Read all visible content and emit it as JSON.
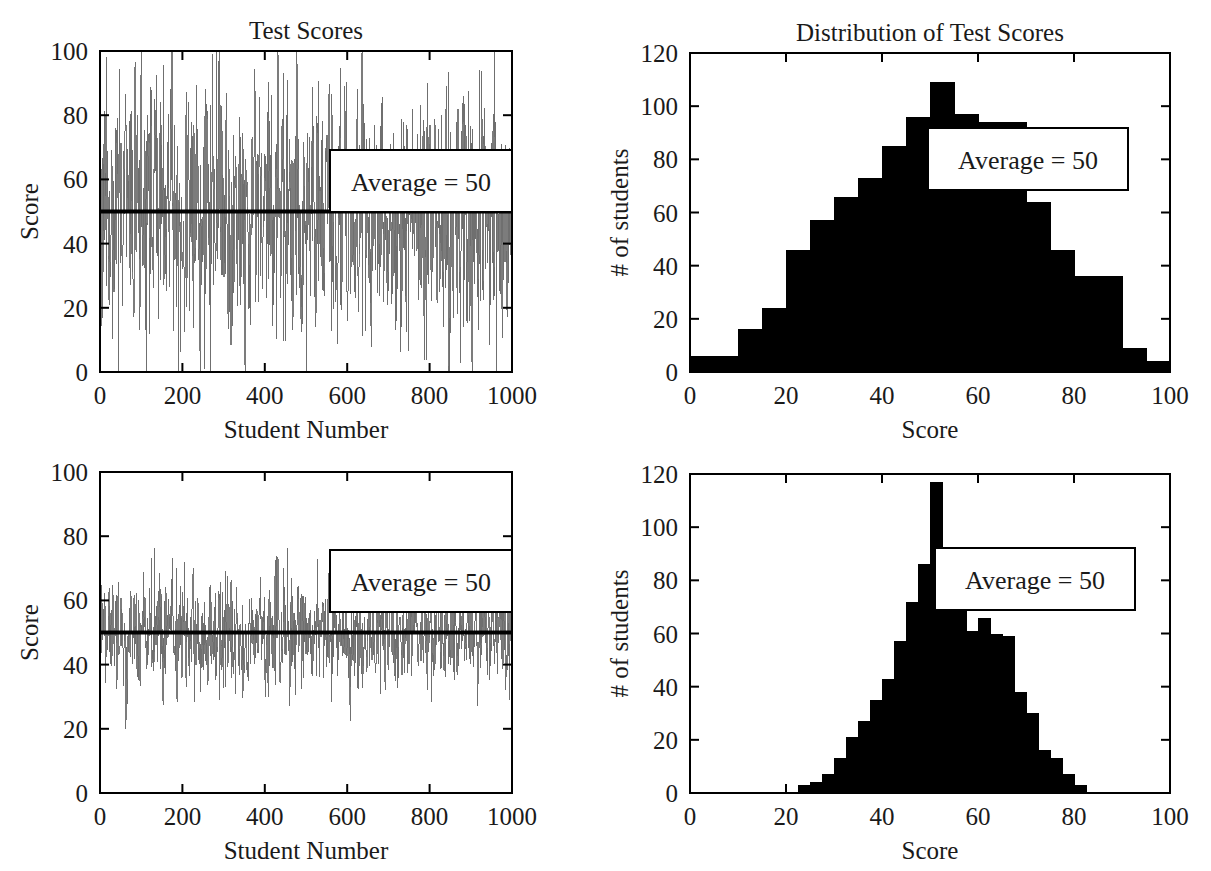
{
  "figure": {
    "background": "#ffffff",
    "ink_color": "#000000",
    "series_color": "#6e6e6e"
  },
  "panels": [
    {
      "id": "top-left",
      "name": "test-scores-series-uniform",
      "title": "Test Scores",
      "xlabel": "Student Number",
      "ylabel": "Score",
      "annotation": "Average = 50",
      "xticks": [
        0,
        200,
        400,
        600,
        800,
        1000
      ],
      "yticks": [
        0,
        20,
        40,
        60,
        80,
        100
      ],
      "xlim": [
        0,
        1000
      ],
      "ylim": [
        0,
        100
      ],
      "mean_line": 50
    },
    {
      "id": "top-right",
      "name": "distribution-uniform-wide",
      "title": "Distribution of Test Scores",
      "xlabel": "Score",
      "ylabel": "# of students",
      "annotation": "Average = 50",
      "xticks": [
        0,
        20,
        40,
        60,
        80,
        100
      ],
      "yticks": [
        0,
        20,
        40,
        60,
        80,
        100,
        120
      ],
      "xlim": [
        0,
        100
      ],
      "ylim": [
        0,
        120
      ]
    },
    {
      "id": "bottom-left",
      "name": "test-scores-series-narrow",
      "title": "",
      "xlabel": "Student Number",
      "ylabel": "Score",
      "annotation": "Average = 50",
      "xticks": [
        0,
        200,
        400,
        600,
        800,
        1000
      ],
      "yticks": [
        0,
        20,
        40,
        60,
        80,
        100
      ],
      "xlim": [
        0,
        1000
      ],
      "ylim": [
        0,
        100
      ],
      "mean_line": 50
    },
    {
      "id": "bottom-right",
      "name": "distribution-narrow",
      "title": "",
      "xlabel": "Score",
      "ylabel": "# of students",
      "annotation": "Average = 50",
      "xticks": [
        0,
        20,
        40,
        60,
        80,
        100
      ],
      "yticks": [
        0,
        20,
        40,
        60,
        80,
        100,
        120
      ],
      "xlim": [
        0,
        100
      ],
      "ylim": [
        0,
        120
      ]
    }
  ],
  "chart_data": [
    {
      "type": "line",
      "panel": "top-left",
      "title": "Test Scores",
      "xlabel": "Student Number",
      "ylabel": "Score",
      "xlim": [
        0,
        1000
      ],
      "ylim": [
        0,
        100
      ],
      "xticks": [
        0,
        200,
        400,
        600,
        800,
        1000
      ],
      "yticks": [
        0,
        20,
        40,
        60,
        80,
        100
      ],
      "grid": false,
      "legend": null,
      "annotations": [
        {
          "text": "Average = 50",
          "x": 640,
          "y": 65,
          "boxed": true
        }
      ],
      "reference_lines": [
        {
          "orientation": "horizontal",
          "value": 50,
          "label": "Average = 50",
          "color": "#000000",
          "width": 4
        }
      ],
      "series": [
        {
          "name": "Test score per student (wide spread)",
          "color": "#6e6e6e",
          "n_points": 1000,
          "distribution": "approximately normal, mean 50, sd 20, clipped to 0-100",
          "mean": 50,
          "sd": 20,
          "min": 0,
          "max": 100,
          "seed": 11
        }
      ]
    },
    {
      "type": "bar",
      "panel": "top-right",
      "title": "Distribution of Test Scores",
      "xlabel": "Score",
      "ylabel": "# of students",
      "xlim": [
        0,
        100
      ],
      "ylim": [
        0,
        120
      ],
      "xticks": [
        0,
        20,
        40,
        60,
        80,
        100
      ],
      "yticks": [
        0,
        20,
        40,
        60,
        80,
        100,
        120
      ],
      "grid": false,
      "bin_width": 5,
      "bin_edges": [
        0,
        5,
        10,
        15,
        20,
        25,
        30,
        35,
        40,
        45,
        50,
        55,
        60,
        65,
        70,
        75,
        80,
        85,
        90,
        95,
        100
      ],
      "categories": [
        "0-5",
        "5-10",
        "10-15",
        "15-20",
        "20-25",
        "25-30",
        "30-35",
        "35-40",
        "40-45",
        "45-50",
        "50-55",
        "55-60",
        "60-65",
        "65-70",
        "70-75",
        "75-80",
        "80-85",
        "85-90",
        "90-95",
        "95-100"
      ],
      "values": [
        6,
        6,
        16,
        24,
        46,
        57,
        66,
        73,
        85,
        96,
        109,
        97,
        94,
        94,
        64,
        46,
        36,
        36,
        9,
        4
      ],
      "bar_color": "#000000",
      "annotations": [
        {
          "text": "Average = 50",
          "boxed": true
        }
      ]
    },
    {
      "type": "line",
      "panel": "bottom-left",
      "title": "",
      "xlabel": "Student Number",
      "ylabel": "Score",
      "xlim": [
        0,
        1000
      ],
      "ylim": [
        0,
        100
      ],
      "xticks": [
        0,
        200,
        400,
        600,
        800,
        1000
      ],
      "yticks": [
        0,
        20,
        40,
        60,
        80,
        100
      ],
      "grid": false,
      "annotations": [
        {
          "text": "Average = 50",
          "x": 640,
          "y": 65,
          "boxed": true
        }
      ],
      "reference_lines": [
        {
          "orientation": "horizontal",
          "value": 50,
          "label": "Average = 50",
          "color": "#000000",
          "width": 4
        }
      ],
      "series": [
        {
          "name": "Test score per student (narrow spread)",
          "color": "#6e6e6e",
          "n_points": 1000,
          "distribution": "approximately normal, mean 50, sd 9",
          "mean": 50,
          "sd": 9,
          "min": 21,
          "max": 82,
          "seed": 29
        }
      ]
    },
    {
      "type": "bar",
      "panel": "bottom-right",
      "title": "",
      "xlabel": "Score",
      "ylabel": "# of students",
      "xlim": [
        0,
        100
      ],
      "ylim": [
        0,
        120
      ],
      "xticks": [
        0,
        20,
        40,
        60,
        80,
        100
      ],
      "yticks": [
        0,
        20,
        40,
        60,
        80,
        100,
        120
      ],
      "grid": false,
      "bin_width": 2.5,
      "bin_edges": [
        20,
        22.5,
        25,
        27.5,
        30,
        32.5,
        35,
        37.5,
        40,
        42.5,
        45,
        47.5,
        50,
        52.5,
        55,
        57.5,
        60,
        62.5,
        65,
        67.5,
        70,
        72.5,
        75,
        77.5,
        80,
        82.5
      ],
      "categories": [
        "20-22.5",
        "22.5-25",
        "25-27.5",
        "27.5-30",
        "30-32.5",
        "32.5-35",
        "35-37.5",
        "37.5-40",
        "40-42.5",
        "42.5-45",
        "45-47.5",
        "47.5-50",
        "50-52.5",
        "52.5-55",
        "55-57.5",
        "57.5-60",
        "60-62.5",
        "62.5-65",
        "65-67.5",
        "67.5-70",
        "70-72.5",
        "72.5-75",
        "75-77.5",
        "77.5-80",
        "80-82.5"
      ],
      "values": [
        0,
        3,
        4,
        7,
        13,
        21,
        27,
        35,
        43,
        57,
        72,
        86,
        117,
        89,
        82,
        61,
        66,
        60,
        59,
        38,
        30,
        16,
        13,
        7,
        3
      ],
      "bar_color": "#000000",
      "annotations": [
        {
          "text": "Average = 50",
          "boxed": true
        }
      ]
    }
  ]
}
